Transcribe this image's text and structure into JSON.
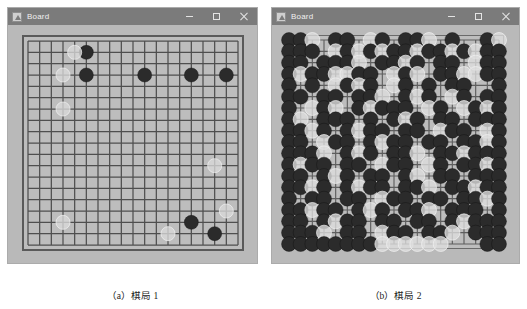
{
  "figure": {
    "background_color": "#ffffff",
    "panels": [
      {
        "id": "a",
        "caption": "（a）棋局 1",
        "window": {
          "title": "Board",
          "app_icon": "board-app-icon",
          "titlebar_color": "#7b7b7b",
          "client_color": "#b9b9b9",
          "buttons": [
            {
              "name": "minimize",
              "glyph": "minimize-icon"
            },
            {
              "name": "maximize",
              "glyph": "maximize-icon"
            },
            {
              "name": "close",
              "glyph": "close-icon"
            }
          ]
        },
        "board": {
          "size": 19,
          "board_color": "#bdbdbd",
          "line_color": "#4f4f4f",
          "border_color": "#5a5a5a",
          "black_color": "#2b2b2b",
          "white_color": "#d9d9d9",
          "stone_count_black": 8,
          "stone_count_white": 7,
          "stones": [
            {
              "color": "black",
              "col": 6,
              "row": 2
            },
            {
              "color": "black",
              "col": 6,
              "row": 4
            },
            {
              "color": "black",
              "col": 11,
              "row": 4
            },
            {
              "color": "black",
              "col": 15,
              "row": 4
            },
            {
              "color": "black",
              "col": 18,
              "row": 4
            },
            {
              "color": "black",
              "col": 15,
              "row": 17
            },
            {
              "color": "black",
              "col": 17,
              "row": 18
            },
            {
              "color": "white",
              "col": 5,
              "row": 2
            },
            {
              "color": "white",
              "col": 4,
              "row": 4
            },
            {
              "color": "white",
              "col": 4,
              "row": 7
            },
            {
              "color": "white",
              "col": 17,
              "row": 12
            },
            {
              "color": "white",
              "col": 18,
              "row": 16
            },
            {
              "color": "white",
              "col": 4,
              "row": 17
            },
            {
              "color": "white",
              "col": 13,
              "row": 18
            }
          ]
        }
      },
      {
        "id": "b",
        "caption": "（b）棋局 2",
        "window": {
          "title": "Board",
          "app_icon": "board-app-icon",
          "titlebar_color": "#7b7b7b",
          "client_color": "#b9b9b9",
          "buttons": [
            {
              "name": "minimize",
              "glyph": "minimize-icon"
            },
            {
              "name": "maximize",
              "glyph": "maximize-icon"
            },
            {
              "name": "close",
              "glyph": "close-icon"
            }
          ]
        },
        "board": {
          "size": 19,
          "board_color": "#bdbdbd",
          "line_color": "#5e5e5e",
          "border_color": "#6a6a6a",
          "black_color": "#2b2b2b",
          "white_color": "#dedede",
          "description": "densely-filled-board",
          "rows": [
            "BBW.BB.WB.BBW.B..BW",
            "BBB.WBWBWBBWBBWBWBB",
            "BB.BBBW.BBWB.BB.WBB",
            "BWBBWWBB.WBW.BBWWBB",
            "B.B.WBWB.WB.B.BB..B",
            "BB.BB.BBW.BWB.WB.BB",
            "B.WBW.BWBBB.WB.WBWB",
            "BW.BBB.B.BWB.BB.BBB",
            "BBWB.BWBB.BB.WBB.WB",
            "BB.WBB.BWBB.BB.BBWB",
            "BBBW.BWB.BBW.BBWBBB",
            "BWBB.BB.WBB.WB.BBWB",
            "BB.BWB.BB.BW.BB.BBB",
            "BBWB.BWBB.BBW.BBWBB",
            "B.BB.BB.WBB.BB.BBWB",
            "BBWBB.BWB.BBW.BBB.B",
            "BB.BWBB.BB.BB.BWBBB",
            "BBBW.BB.WBB.BBW.BBB",
            "BBBBBBBBWWWWWW...BB"
          ]
        }
      }
    ]
  }
}
